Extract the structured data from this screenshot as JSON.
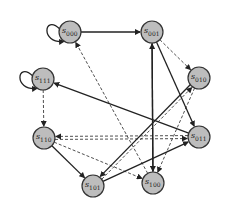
{
  "diagram": {
    "type": "state-transition",
    "node_style": {
      "fill": "#bdbdbd",
      "stroke": "#333333"
    },
    "nodes": [
      {
        "id": "s000",
        "prefix": "s",
        "sub": "000",
        "x": 70,
        "y": 32
      },
      {
        "id": "s001",
        "prefix": "s",
        "sub": "001",
        "x": 152,
        "y": 32
      },
      {
        "id": "s010",
        "prefix": "s",
        "sub": "010",
        "x": 199,
        "y": 78
      },
      {
        "id": "s011",
        "prefix": "s",
        "sub": "011",
        "x": 199,
        "y": 137
      },
      {
        "id": "s100",
        "prefix": "s",
        "sub": "100",
        "x": 153,
        "y": 183
      },
      {
        "id": "s101",
        "prefix": "s",
        "sub": "101",
        "x": 93,
        "y": 186
      },
      {
        "id": "s110",
        "prefix": "s",
        "sub": "110",
        "x": 44,
        "y": 138
      },
      {
        "id": "s111",
        "prefix": "s",
        "sub": "111",
        "x": 43,
        "y": 79
      }
    ],
    "edges": [
      {
        "from": "s000",
        "to": "s000",
        "style": "solid",
        "self_loop": true
      },
      {
        "from": "s111",
        "to": "s111",
        "style": "solid",
        "self_loop": true
      },
      {
        "from": "s000",
        "to": "s001",
        "style": "solid"
      },
      {
        "from": "s001",
        "to": "s010",
        "style": "dashed"
      },
      {
        "from": "s001",
        "to": "s011",
        "style": "solid"
      },
      {
        "from": "s100",
        "to": "s001",
        "style": "solid"
      },
      {
        "from": "s001",
        "to": "s100",
        "style": "solid"
      },
      {
        "from": "s011",
        "to": "s111",
        "style": "solid"
      },
      {
        "from": "s111",
        "to": "s110",
        "style": "dashed"
      },
      {
        "from": "s011",
        "to": "s110",
        "style": "dashed"
      },
      {
        "from": "s110",
        "to": "s011",
        "style": "dashed"
      },
      {
        "from": "s110",
        "to": "s101",
        "style": "solid"
      },
      {
        "from": "s101",
        "to": "s010",
        "style": "dashed"
      },
      {
        "from": "s010",
        "to": "s101",
        "style": "solid"
      },
      {
        "from": "s101",
        "to": "s011",
        "style": "solid"
      },
      {
        "from": "s100",
        "to": "s000",
        "style": "dashed"
      },
      {
        "from": "s110",
        "to": "s100",
        "style": "dashed"
      },
      {
        "from": "s010",
        "to": "s100",
        "style": "dashed"
      }
    ]
  }
}
